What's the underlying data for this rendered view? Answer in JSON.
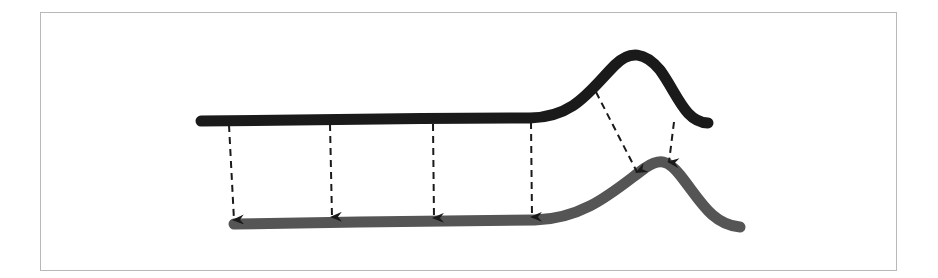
{
  "diagram": {
    "type": "signal-warping",
    "colors": {
      "frame_border": "#b8b8b8",
      "source_curve": "#1a1a1a",
      "target_curve": "#555555",
      "arrow": "#1a1a1a",
      "background": "#ffffff"
    },
    "source_curve": {
      "name": "source-signal",
      "path": "M 201 121 C 300 120, 420 118, 530 118 C 575 117, 590 90, 615 65 C 630 50, 645 52, 660 70 C 678 95, 685 122, 708 123"
    },
    "target_curve": {
      "name": "target-signal",
      "path": "M 234 224 C 330 222, 450 221, 535 220 C 585 219, 615 190, 645 168 C 660 158, 668 160, 680 175 C 700 200, 712 225, 740 227"
    },
    "arrows": [
      {
        "x1": 229,
        "y1": 125,
        "x2": 234,
        "y2": 220
      },
      {
        "x1": 330,
        "y1": 124,
        "x2": 332,
        "y2": 217
      },
      {
        "x1": 433,
        "y1": 124,
        "x2": 434,
        "y2": 218
      },
      {
        "x1": 531,
        "y1": 122,
        "x2": 532,
        "y2": 217
      },
      {
        "x1": 596,
        "y1": 92,
        "x2": 637,
        "y2": 172
      },
      {
        "x1": 674,
        "y1": 122,
        "x2": 669,
        "y2": 162
      }
    ]
  }
}
